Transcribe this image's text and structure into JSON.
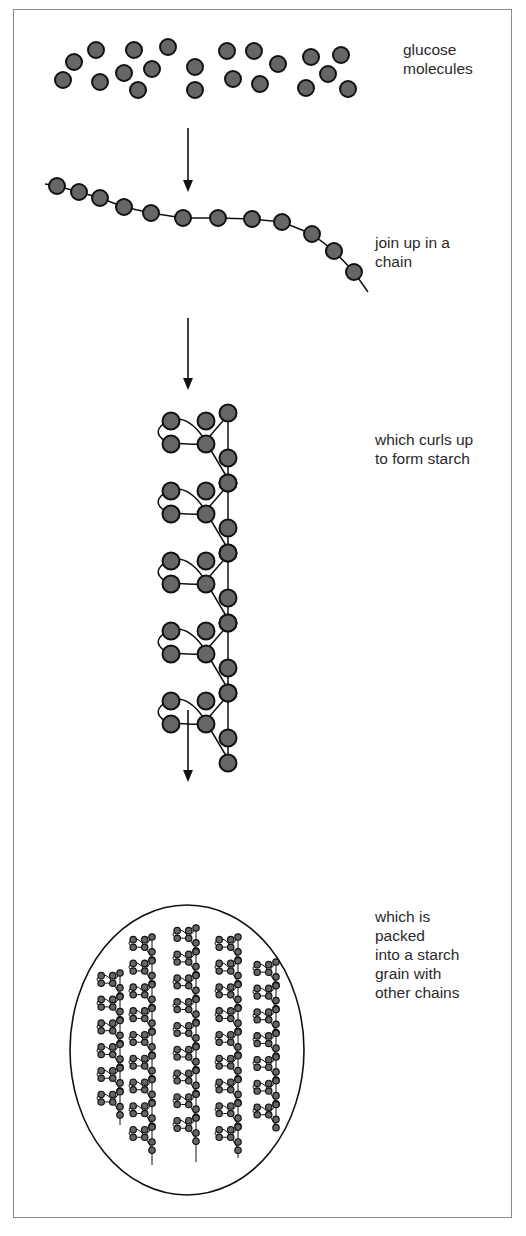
{
  "diagram": {
    "colors": {
      "molecule_fill": "#666666",
      "stroke": "#111111",
      "frame": "#8a8a8a",
      "text": "#2a2a2a"
    },
    "steps": [
      {
        "id": "glucose",
        "label": "glucose\nmolecules",
        "label_pos": [
          403,
          50
        ]
      },
      {
        "id": "chain",
        "label": "join up in a\nchain",
        "label_pos": [
          375,
          235
        ]
      },
      {
        "id": "curl",
        "label": "which curls up\nto form starch",
        "label_pos": [
          375,
          432
        ]
      },
      {
        "id": "grain",
        "label": "which is\npacked\ninto a  starch\ngrain with\nother chains",
        "label_pos": [
          375,
          909
        ]
      }
    ],
    "arrows": [
      {
        "x": 188,
        "y1": 128,
        "y2": 192
      },
      {
        "x": 188,
        "y1": 318,
        "y2": 390
      },
      {
        "x": 188,
        "y1": 710,
        "y2": 782
      }
    ],
    "glucose_molecules": [
      [
        63,
        80
      ],
      [
        74,
        62
      ],
      [
        96,
        50
      ],
      [
        100,
        82
      ],
      [
        124,
        73
      ],
      [
        134,
        50
      ],
      [
        138,
        90
      ],
      [
        152,
        69
      ],
      [
        168,
        47
      ],
      [
        195,
        67
      ],
      [
        195,
        90
      ],
      [
        227,
        51
      ],
      [
        233,
        79
      ],
      [
        254,
        51
      ],
      [
        260,
        84
      ],
      [
        278,
        64
      ],
      [
        306,
        88
      ],
      [
        311,
        57
      ],
      [
        328,
        74
      ],
      [
        341,
        55
      ],
      [
        348,
        89
      ]
    ],
    "chain_points": [
      [
        57,
        186
      ],
      [
        79,
        192
      ],
      [
        100,
        198
      ],
      [
        124,
        207
      ],
      [
        151,
        213
      ],
      [
        183,
        218
      ],
      [
        218,
        218
      ],
      [
        252,
        219
      ],
      [
        282,
        222
      ],
      [
        312,
        234
      ],
      [
        334,
        251
      ],
      [
        354,
        272
      ]
    ],
    "chain_tail": {
      "start": [
        45,
        184
      ],
      "end": [
        368,
        292
      ]
    },
    "helix": {
      "x_spine": 228,
      "top": 416,
      "bottom": 770,
      "turns_y": [
        413,
        483,
        553,
        623,
        693
      ]
    },
    "grain": {
      "cx": 187,
      "cy": 1050,
      "rx": 117,
      "ry": 145,
      "columns": [
        {
          "x": 120,
          "top": 973,
          "bottom": 1125
        },
        {
          "x": 152,
          "top": 937,
          "bottom": 1165
        },
        {
          "x": 196,
          "top": 928,
          "bottom": 1162
        },
        {
          "x": 238,
          "top": 937,
          "bottom": 1158
        },
        {
          "x": 276,
          "top": 962,
          "bottom": 1128
        }
      ]
    }
  }
}
